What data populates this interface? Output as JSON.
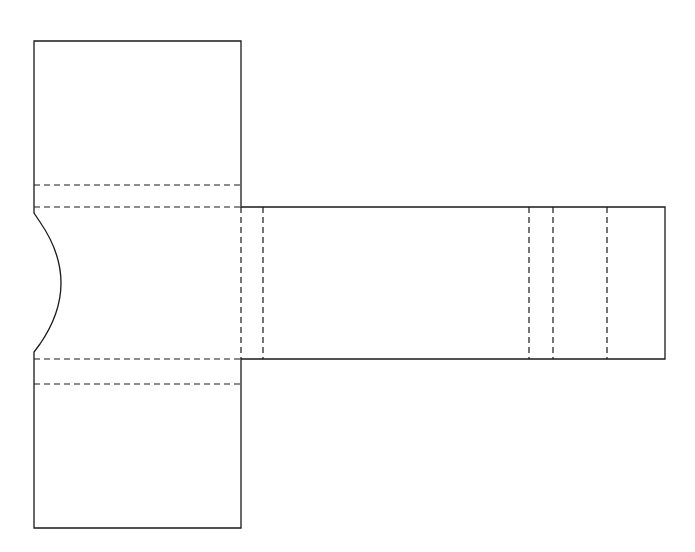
{
  "diagram": {
    "type": "packaging-dieline",
    "line_styles": {
      "cut": {
        "color": "#1a1a1a",
        "style": "solid"
      },
      "fold": {
        "color": "#1a1a1a",
        "style": "dashed"
      }
    },
    "parts": [
      {
        "id": "top-flap",
        "kind": "panel"
      },
      {
        "id": "top-tuck-fold-1",
        "kind": "fold-line"
      },
      {
        "id": "top-tuck-fold-2",
        "kind": "fold-line"
      },
      {
        "id": "center-panel",
        "kind": "panel",
        "feature": "thumb-notch"
      },
      {
        "id": "bottom-tuck-fold-1",
        "kind": "fold-line"
      },
      {
        "id": "bottom-tuck-fold-2",
        "kind": "fold-line"
      },
      {
        "id": "bottom-flap",
        "kind": "panel"
      },
      {
        "id": "side-strip",
        "kind": "panel"
      },
      {
        "id": "strip-fold-1",
        "kind": "fold-line"
      },
      {
        "id": "strip-fold-2",
        "kind": "fold-line"
      },
      {
        "id": "strip-fold-3",
        "kind": "fold-line"
      },
      {
        "id": "strip-fold-4",
        "kind": "fold-line"
      },
      {
        "id": "strip-fold-5",
        "kind": "fold-line"
      }
    ]
  }
}
